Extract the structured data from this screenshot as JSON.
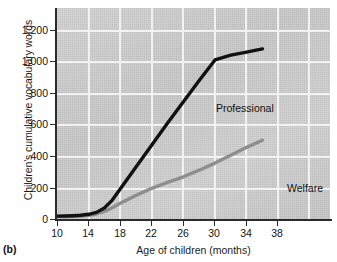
{
  "panel": {
    "tag": "(b)"
  },
  "chart_data": {
    "type": "line",
    "title": "",
    "xlabel": "Age of children (months)",
    "ylabel": "Children's cumulative vocabulary words",
    "xlim": [
      10,
      38
    ],
    "ylim": [
      0,
      1300
    ],
    "xticks": [
      "10",
      "14",
      "18",
      "22",
      "26",
      "30",
      "34",
      "38"
    ],
    "xtick_values": [
      10,
      14,
      18,
      22,
      26,
      30,
      34,
      38
    ],
    "yticks": [
      "0",
      "200",
      "400",
      "600",
      "800",
      "1,000",
      "1,200"
    ],
    "ytick_values": [
      0,
      200,
      400,
      600,
      800,
      1000,
      1200
    ],
    "grid": true,
    "legend_position": "inline-annotations",
    "series": [
      {
        "name": "Professional",
        "color": "#111111",
        "x": [
          10,
          11,
          12,
          13,
          14,
          15,
          16,
          17,
          18,
          20,
          22,
          24,
          26,
          28,
          30,
          32,
          34,
          36
        ],
        "values": [
          18,
          19,
          21,
          24,
          30,
          42,
          70,
          120,
          190,
          330,
          470,
          610,
          745,
          880,
          1010,
          1040,
          1060,
          1080
        ]
      },
      {
        "name": "Welfare",
        "color": "#8e8e8e",
        "x": [
          10,
          11,
          12,
          13,
          14,
          15,
          16,
          17,
          18,
          20,
          22,
          24,
          26,
          28,
          30,
          32,
          34,
          36
        ],
        "values": [
          15,
          16,
          17,
          19,
          23,
          32,
          48,
          72,
          100,
          150,
          195,
          232,
          268,
          310,
          355,
          405,
          455,
          500
        ]
      }
    ],
    "annotations": [
      {
        "text": "Professional",
        "x": 22.5,
        "y": 740
      },
      {
        "text": "Welfare",
        "x": 31.0,
        "y": 245
      }
    ]
  }
}
